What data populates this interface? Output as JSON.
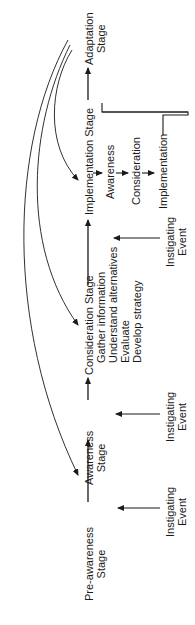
{
  "diagram": {
    "stages": [
      {
        "id": "pre-awareness",
        "line1": "Pre-awareness",
        "line2": "Stage"
      },
      {
        "id": "awareness",
        "line1": "Awareness",
        "line2": "Stage"
      },
      {
        "id": "consideration",
        "line1": "Consideration Stage",
        "details": [
          "Gather information",
          "Understand alternatives",
          "Evaluate",
          "Develop strategy"
        ]
      },
      {
        "id": "implementation",
        "line1": "Implementation Stage"
      },
      {
        "id": "adaptation",
        "line1": "Adaptation",
        "line2": "Stage"
      }
    ],
    "implementation_loop": [
      "Awareness",
      "Consideration",
      "Implementation"
    ],
    "instigating_events": [
      {
        "line1": "Instigating",
        "line2": "Event"
      },
      {
        "line1": "Instigating",
        "line2": "Event"
      },
      {
        "line1": "Instigating",
        "line2": "Event"
      }
    ],
    "orientation": "rotated -90deg",
    "colors": {
      "ink": "#1a1a1a",
      "background": "#ffffff"
    }
  }
}
